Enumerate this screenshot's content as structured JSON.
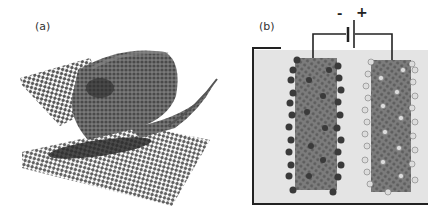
{
  "figure": {
    "panels": [
      {
        "id": "a",
        "label": "(a)",
        "description": "Graphene sheet rolling into a carbon nanotube above a flat graphene lattice"
      },
      {
        "id": "b",
        "label": "(b)",
        "description": "Supercapacitor: two carbon nanotube electrodes in electrolyte connected to a battery",
        "battery": {
          "negative_sign": "-",
          "positive_sign": "+"
        },
        "electrodes": [
          {
            "name": "negative-electrode",
            "ion_color": "#3a3a3a"
          },
          {
            "name": "positive-electrode",
            "ion_color": "#d8d8d8"
          }
        ]
      }
    ]
  },
  "colors": {
    "lattice": "#5a5a5a",
    "lattice_dark": "#333333",
    "electrolyte": "#e4e4e4",
    "tube": "#7a7a7a",
    "wire": "#222222"
  }
}
